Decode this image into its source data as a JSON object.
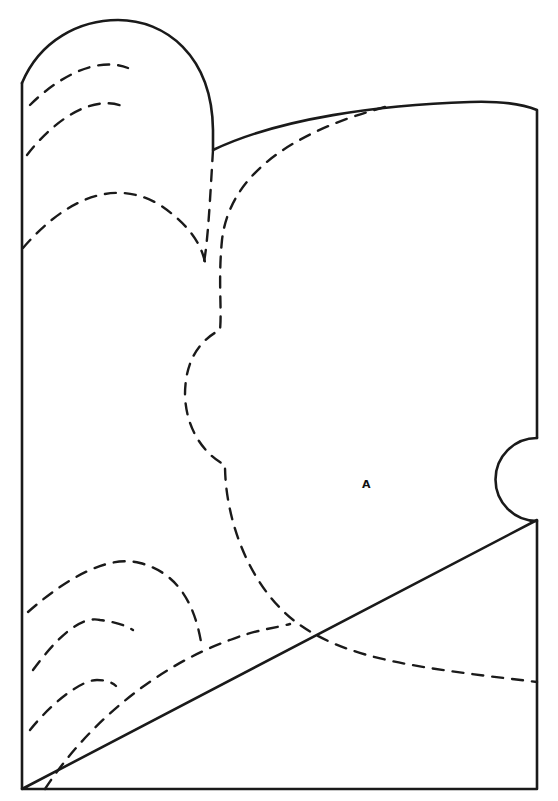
{
  "diagram": {
    "label_a": "A",
    "colors": {
      "line": "#1a1a1a",
      "background": "#ffffff"
    },
    "outline": {
      "main": "M 22 83 C 40 40, 80 20, 118 20 C 165 20, 212 55, 213 130 L 213 150 C 280 118, 380 105, 470 102 C 500 101, 520 103, 537 110 L 537 438",
      "main_lower": "M 537 520 L 537 789 L 22 789 Z",
      "left_edge": "M 22 83 L 22 789",
      "semicircle": "M 537 438 A 41 41 0 0 0 537 521"
    },
    "dashed_paths": {
      "top_arc_1": "M 30 105 C 55 80, 95 55, 128 68",
      "top_arc_2": "M 27 155 C 50 125, 90 92, 125 107",
      "mid_arc": "M 23 248 C 60 205, 110 175, 160 205 C 185 222, 200 240, 205 262",
      "gusset_line": "M 213 150 C 210 200, 208 240, 204 262",
      "center_body": "M 385 107 C 300 130, 230 170, 222 240 C 218 280, 222 310, 220 330 C 200 340, 185 360, 185 395 C 186 430, 205 455, 225 465 C 225 520, 250 590, 300 625 C 350 660, 420 668, 537 682",
      "bottom_arc_outer": "M 28 612 C 70 575, 110 555, 140 563 C 175 572, 195 600, 202 648",
      "bottom_arc_mid": "M 33 670 C 55 640, 80 615, 100 620 C 115 622, 125 625, 133 630",
      "bottom_arc_inner": "M 30 730 C 50 705, 80 680, 97 680 C 105 680, 112 682, 116 686",
      "bottom_long": "M 45 789 C 90 720, 160 665, 230 640 C 255 630, 275 628, 290 624"
    },
    "label_position": {
      "x": "362",
      "y": "488"
    }
  }
}
